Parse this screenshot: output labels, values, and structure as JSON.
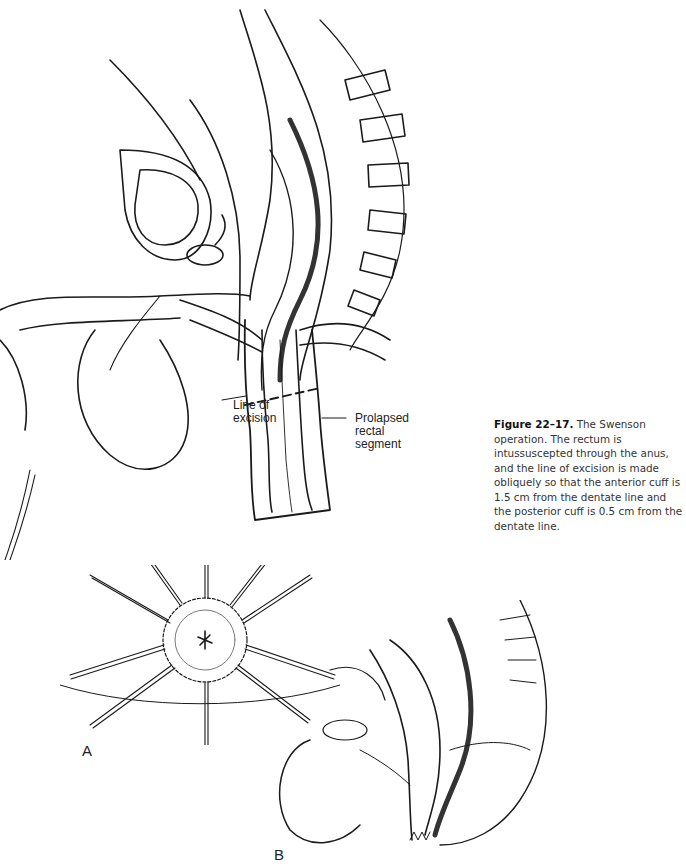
{
  "figure": {
    "number_label": "Figure 22–17.",
    "caption_text": "The Swenson operation. The rectum is intussuscepted through the anus, and the line of excision is made obliquely so that the anterior cuff is 1.5 cm from the dentate line and the posterior cuff is 0.5 cm from the dentate line."
  },
  "annotations": {
    "line_of_excision": [
      "Line of",
      "excision"
    ],
    "prolapsed_segment": [
      "Prolapsed",
      "rectal",
      "segment"
    ]
  },
  "panels": {
    "a": "A",
    "b": "B"
  },
  "colors": {
    "ink": "#1a1a1a",
    "caption": "#333333",
    "background": "#ffffff"
  }
}
